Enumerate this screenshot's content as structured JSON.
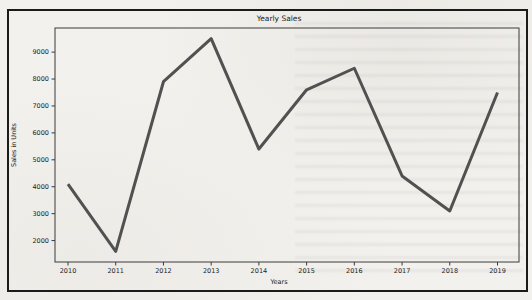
{
  "figure": {
    "background_color": "#f3f1ed",
    "frame_color": "#1b1b1b"
  },
  "chart_data": {
    "type": "line",
    "title": "Yearly Sales",
    "xlabel": "Years",
    "ylabel": "Sales in Units",
    "categories": [
      "2010",
      "2011",
      "2012",
      "2013",
      "2014",
      "2015",
      "2016",
      "2017",
      "2018",
      "2019"
    ],
    "values": [
      4100,
      1600,
      7900,
      9500,
      5400,
      7600,
      8400,
      4400,
      3100,
      7500
    ],
    "yticks": [
      2000,
      3000,
      4000,
      5000,
      6000,
      7000,
      8000,
      9000
    ],
    "ylim": [
      1205,
      9895
    ],
    "grid": false,
    "line_color": "#515151",
    "line_width": 3
  }
}
